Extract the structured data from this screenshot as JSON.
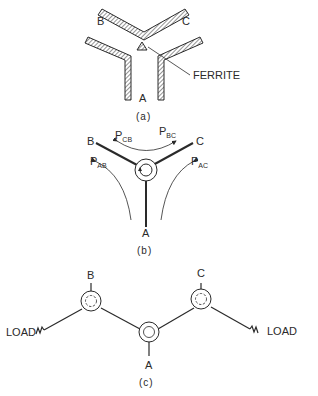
{
  "figure_a": {
    "caption": "(a)",
    "ports": {
      "a": "A",
      "b": "B",
      "c": "C"
    },
    "annotation": "FERRITE"
  },
  "figure_b": {
    "caption": "(b)",
    "ports": {
      "a": "A",
      "b": "B",
      "c": "C"
    },
    "paths": [
      {
        "main": "P",
        "sub": "CB"
      },
      {
        "main": "P",
        "sub": "BC"
      },
      {
        "main": "P",
        "sub": "AB"
      },
      {
        "main": "P",
        "sub": "AC"
      }
    ]
  },
  "figure_c": {
    "caption": "(c)",
    "ports": {
      "a": "A",
      "b": "B",
      "c": "C"
    },
    "load_left": "LOAD",
    "load_right": "LOAD"
  },
  "colors": {
    "ink": "#2a2a2a",
    "background": "#ffffff"
  }
}
